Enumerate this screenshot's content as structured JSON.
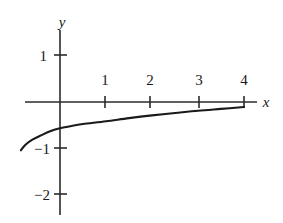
{
  "figure": {
    "background_color": "#ffffff",
    "ink_color": "#1a1a1a",
    "width": 283,
    "height": 223
  },
  "axes": {
    "x_label": "x",
    "y_label": "y",
    "x_axis_pixel_y": 102,
    "y_axis_pixel_x": 60,
    "pixels_per_unit_x": 46,
    "pixels_per_unit_y": 46,
    "x_axis_start_px": 25,
    "x_axis_end_px": 257,
    "y_axis_start_px": 30,
    "y_axis_end_px": 215
  },
  "x_ticks": [
    {
      "label": "1",
      "value": 1,
      "px": 105
    },
    {
      "label": "2",
      "value": 2,
      "px": 150
    },
    {
      "label": "3",
      "value": 3,
      "px": 199
    },
    {
      "label": "4",
      "value": 4,
      "px": 244
    }
  ],
  "y_ticks": [
    {
      "label": "1",
      "value": 1,
      "px": 55
    },
    {
      "label": "−1",
      "value": -1,
      "px": 148
    },
    {
      "label": "−2",
      "value": -2,
      "px": 194
    }
  ],
  "chart_data": {
    "type": "line",
    "title": "",
    "xlabel": "x",
    "ylabel": "y",
    "xlim": [
      -1.2,
      4.3
    ],
    "ylim": [
      -2.3,
      1.3
    ],
    "grid": false,
    "legend": null,
    "series": [
      {
        "name": "curve",
        "description": "increasing concave-down logarithmic curve",
        "x": [
          -0.85,
          -0.75,
          -0.6,
          -0.4,
          -0.2,
          0.0,
          0.25,
          0.5,
          1.0,
          1.5,
          2.0,
          2.5,
          3.0,
          3.5,
          4.0
        ],
        "y": [
          -1.05,
          -0.93,
          -0.82,
          -0.72,
          -0.63,
          -0.57,
          -0.52,
          -0.48,
          -0.42,
          -0.35,
          -0.29,
          -0.24,
          -0.19,
          -0.15,
          -0.11
        ]
      }
    ],
    "x_tick_labels": [
      "1",
      "2",
      "3",
      "4"
    ],
    "x_tick_values": [
      1,
      2,
      3,
      4
    ],
    "y_tick_labels": [
      "1",
      "−1",
      "−2"
    ],
    "y_tick_values": [
      1,
      -1,
      -2
    ]
  }
}
